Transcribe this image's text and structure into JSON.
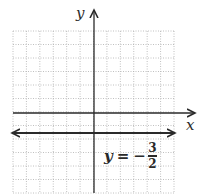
{
  "chart_data": {
    "type": "line",
    "title": "",
    "xlabel": "x",
    "ylabel": "y",
    "grid": true,
    "grid_style": "dotted",
    "xlim": [
      -6,
      6
    ],
    "ylim": [
      -6,
      6
    ],
    "x_axis_arrow": "right",
    "y_axis_arrow": "up",
    "series": [
      {
        "name": "y = -3/2",
        "equation": "y = -3/2",
        "kind": "horizontal-line",
        "y": -1.5,
        "x": [
          -6,
          6
        ],
        "arrows": "both"
      }
    ],
    "annotations": [
      {
        "text": "y = -3/2",
        "x": 1,
        "y": -2.5
      }
    ]
  },
  "labels": {
    "x_axis": "x",
    "y_axis": "y",
    "equation_var": "y",
    "equation_eq": "=",
    "equation_minus": "−",
    "equation_num": "3",
    "equation_den": "2"
  },
  "colors": {
    "axis": "#2a2a2a",
    "line": "#2a2a2a",
    "grid": "#b0b0b0",
    "background": "#ffffff"
  }
}
